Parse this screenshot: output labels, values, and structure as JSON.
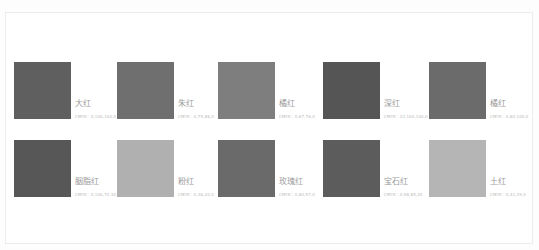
{
  "swatches": [
    {
      "name": "大红",
      "cmyk": "CMYK：0,100,100,0",
      "color": "#5f5f5f"
    },
    {
      "name": "朱红",
      "cmyk": "CMYK：0,75,88,0",
      "color": "#6f6f6f"
    },
    {
      "name": "橘红",
      "cmyk": "CMYK：0,67,76,0",
      "color": "#7e7e7e"
    },
    {
      "name": "深红",
      "cmyk": "CMYK：22,100,100,0",
      "color": "#555555"
    },
    {
      "name": "橘红",
      "cmyk": "CMYK：0,80,100,0",
      "color": "#6b6b6b"
    },
    {
      "name": "胭脂红",
      "cmyk": "CMYK：0,100,70,30",
      "color": "#575757"
    },
    {
      "name": "粉红",
      "cmyk": "CMYK：0,36,20,0",
      "color": "#b0b0b0"
    },
    {
      "name": "玫瑰红",
      "cmyk": "CMYK：0,80,57,0",
      "color": "#6a6a6a"
    },
    {
      "name": "宝石红",
      "cmyk": "CMYK：0,98,85,20",
      "color": "#5c5c5c"
    },
    {
      "name": "土红",
      "cmyk": "CMYK：0,42,29,0",
      "color": "#b5b5b5"
    }
  ]
}
